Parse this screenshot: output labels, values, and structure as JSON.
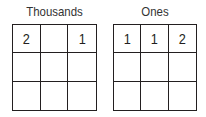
{
  "groups": [
    {
      "title": "Thousands",
      "cells": [
        [
          "2",
          "",
          "1"
        ],
        [
          "",
          "",
          ""
        ],
        [
          "",
          "",
          ""
        ]
      ]
    },
    {
      "title": "Ones",
      "cells": [
        [
          "1",
          "1",
          "2"
        ],
        [
          "",
          "",
          ""
        ],
        [
          "",
          "",
          ""
        ]
      ]
    }
  ]
}
